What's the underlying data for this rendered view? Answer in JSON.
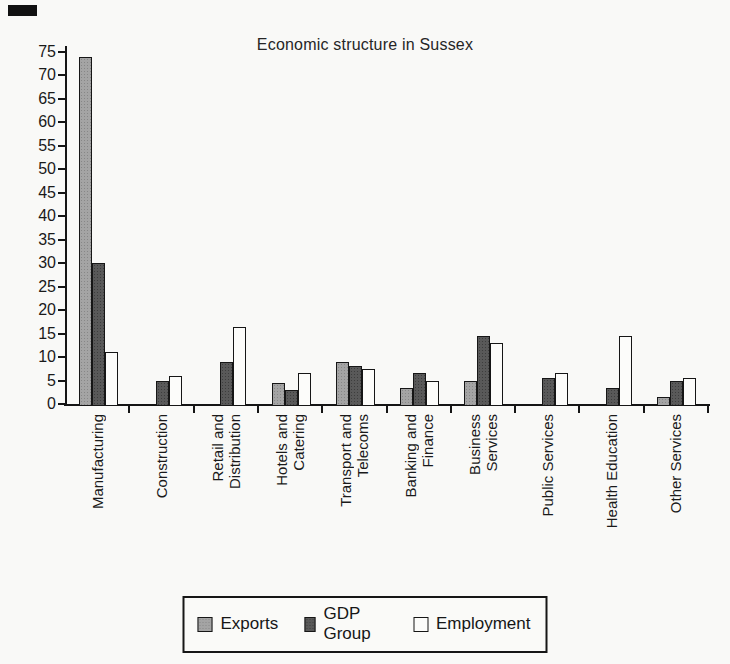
{
  "title": "Economic structure in Sussex",
  "chart_data": {
    "type": "bar",
    "title": "Economic structure in Sussex",
    "categories": [
      "Manufacturing",
      "Construction",
      "Retail and Distribution",
      "Hotels and Catering",
      "Transport and Telecoms",
      "Banking and Finance",
      "Business Services",
      "Public Services",
      "Health Education",
      "Other Services"
    ],
    "category_display_lines": [
      [
        "Manufacturing"
      ],
      [
        "Construction"
      ],
      [
        "Retail and",
        "Distribution"
      ],
      [
        "Hotels and",
        "Catering"
      ],
      [
        "Transport and",
        "Telecoms"
      ],
      [
        "Banking and",
        "Finance"
      ],
      [
        "Business",
        "Services"
      ],
      [
        "Public Services"
      ],
      [
        "Health Education"
      ],
      [
        "Other Services"
      ]
    ],
    "series": [
      {
        "name": "Exports",
        "color": "#a4a4a4",
        "values": [
          74,
          0,
          0,
          4.5,
          9,
          3.5,
          5,
          0,
          0,
          1.5
        ]
      },
      {
        "name": "GDP Group",
        "color": "#595959",
        "values": [
          30,
          5,
          9,
          3,
          8,
          6.5,
          14.5,
          5.5,
          3.5,
          5
        ]
      },
      {
        "name": "Employment",
        "color": "#fcfcfa",
        "values": [
          11,
          6,
          16.5,
          6.5,
          7.5,
          5,
          13,
          6.5,
          14.5,
          5.5
        ]
      }
    ],
    "ylim": [
      0,
      75
    ],
    "ytick_step": 5,
    "grid": false,
    "legend_position": "bottom"
  },
  "legend": {
    "items": [
      "Exports",
      "GDP Group",
      "Employment"
    ]
  }
}
